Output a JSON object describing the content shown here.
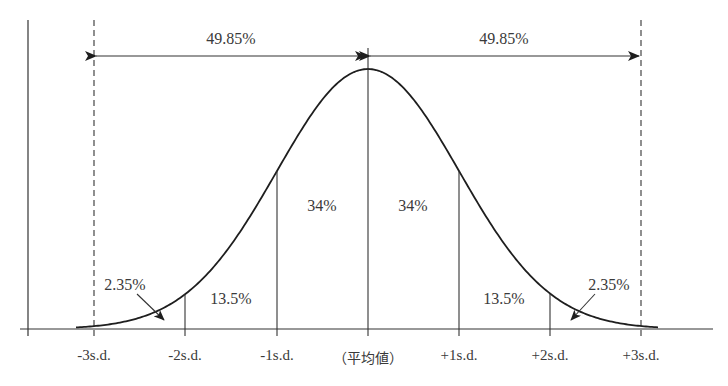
{
  "diagram": {
    "type": "normal-distribution",
    "colors": {
      "line": "#2b2b2b",
      "text": "#3a3a3a",
      "background": "#ffffff"
    },
    "top_labels": {
      "left_half": "49.85%",
      "right_half": "49.85%"
    },
    "region_labels": {
      "left_tail": "2.35%",
      "left_2sd": "13.5%",
      "left_1sd": "34%",
      "right_1sd": "34%",
      "right_2sd": "13.5%",
      "right_tail": "2.35%"
    },
    "axis_ticks": [
      {
        "label": "-3s.d.",
        "x": 94
      },
      {
        "label": "-2s.d.",
        "x": 185
      },
      {
        "label": "-1s.d.",
        "x": 277
      },
      {
        "label": "（平均値）",
        "x": 368
      },
      {
        "label": "+1s.d.",
        "x": 459
      },
      {
        "label": "+2s.d.",
        "x": 550
      },
      {
        "label": "+3s.d.",
        "x": 641
      }
    ]
  },
  "chart_data": {
    "type": "area",
    "title": "",
    "xlabel": "",
    "ylabel": "",
    "categories": [
      "-3s.d.",
      "-2s.d.",
      "-1s.d.",
      "平均値",
      "+1s.d.",
      "+2s.d.",
      "+3s.d."
    ],
    "regions": [
      {
        "from": "-3s.d.",
        "to": "-2s.d.",
        "percent": 2.35
      },
      {
        "from": "-2s.d.",
        "to": "-1s.d.",
        "percent": 13.5
      },
      {
        "from": "-1s.d.",
        "to": "mean",
        "percent": 34
      },
      {
        "from": "mean",
        "to": "+1s.d.",
        "percent": 34
      },
      {
        "from": "+1s.d.",
        "to": "+2s.d.",
        "percent": 13.5
      },
      {
        "from": "+2s.d.",
        "to": "+3s.d.",
        "percent": 2.35
      }
    ],
    "spans": [
      {
        "from": "-3s.d.",
        "to": "mean",
        "percent": 49.85
      },
      {
        "from": "mean",
        "to": "+3s.d.",
        "percent": 49.85
      }
    ]
  }
}
